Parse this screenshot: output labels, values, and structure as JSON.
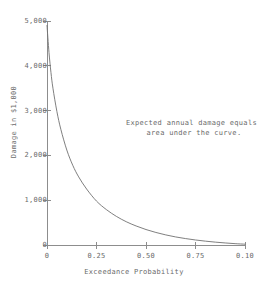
{
  "chart_data": {
    "type": "line",
    "title": "",
    "xlabel": "Exceedance Probability",
    "ylabel": "Damage in $1,000",
    "xlim": [
      0,
      1.0
    ],
    "ylim": [
      0,
      5000
    ],
    "grid": false,
    "legend": null,
    "annotations": [
      {
        "text_line_1": "Expected annual damage equals",
        "text_line_2": "area under the curve.",
        "x": 0.52,
        "y": 2600
      }
    ],
    "x_tick_labels": [
      "0",
      "0.25",
      "0.50",
      "0.75",
      "0.10"
    ],
    "x_tick_values": [
      0,
      0.25,
      0.5,
      0.75,
      1.0
    ],
    "y_tick_labels": [
      "0",
      "1,000",
      "2,000",
      "3,000",
      "4,000",
      "5,000"
    ],
    "y_tick_values": [
      0,
      1000,
      2000,
      3000,
      4000,
      5000
    ],
    "series": [
      {
        "name": "damage-exceedance-curve",
        "color": "#707070",
        "x": [
          0.0,
          0.01,
          0.02,
          0.03,
          0.05,
          0.07,
          0.1,
          0.13,
          0.16,
          0.2,
          0.25,
          0.3,
          0.35,
          0.4,
          0.45,
          0.5,
          0.55,
          0.6,
          0.65,
          0.7,
          0.75,
          0.8,
          0.85,
          0.9,
          0.95,
          1.0
        ],
        "y": [
          4900,
          4300,
          3850,
          3500,
          2980,
          2580,
          2120,
          1780,
          1520,
          1250,
          980,
          790,
          640,
          520,
          425,
          345,
          280,
          225,
          180,
          143,
          112,
          86,
          64,
          46,
          30,
          18
        ]
      }
    ]
  },
  "axes": {
    "y_title": "Damage in $1,000",
    "x_title": "Exceedance Probability",
    "y_ticks": [
      {
        "label": "5,000",
        "value": 5000
      },
      {
        "label": "4,000",
        "value": 4000
      },
      {
        "label": "3,000",
        "value": 3000
      },
      {
        "label": "2,000",
        "value": 2000
      },
      {
        "label": "1,000",
        "value": 1000
      },
      {
        "label": "0",
        "value": 0
      }
    ],
    "x_ticks": [
      {
        "label": "0",
        "value": 0
      },
      {
        "label": "0.25",
        "value": 0.25
      },
      {
        "label": "0.50",
        "value": 0.5
      },
      {
        "label": "0.75",
        "value": 0.75
      },
      {
        "label": "0.10",
        "value": 1.0
      }
    ]
  },
  "annotation": {
    "line_1": "Expected annual damage equals",
    "line_2": "area under the curve."
  },
  "colors": {
    "curve": "#707070",
    "axis": "#8d8d8d",
    "text": "#6a6a6a",
    "background": "#ffffff"
  }
}
